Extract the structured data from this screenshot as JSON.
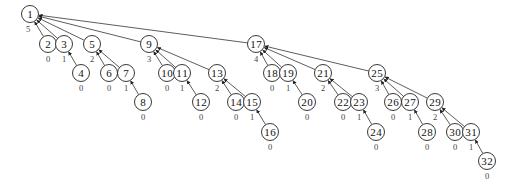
{
  "diagram": {
    "type": "binomial-tree",
    "node_radius": 8.5,
    "edge_direction": "child-to-parent",
    "nodes": [
      {
        "id": 1,
        "x": 30,
        "y": 14,
        "rank": 5,
        "parent": null
      },
      {
        "id": 2,
        "x": 48,
        "y": 44,
        "rank": 0,
        "parent": 1
      },
      {
        "id": 3,
        "x": 64,
        "y": 44,
        "rank": 1,
        "parent": 1
      },
      {
        "id": 4,
        "x": 81,
        "y": 73,
        "rank": 0,
        "parent": 3
      },
      {
        "id": 5,
        "x": 92,
        "y": 44,
        "rank": 2,
        "parent": 1
      },
      {
        "id": 6,
        "x": 109,
        "y": 73,
        "rank": 0,
        "parent": 5
      },
      {
        "id": 7,
        "x": 126,
        "y": 73,
        "rank": 1,
        "parent": 5
      },
      {
        "id": 8,
        "x": 143,
        "y": 102,
        "rank": 0,
        "parent": 7
      },
      {
        "id": 9,
        "x": 149,
        "y": 44,
        "rank": 3,
        "parent": 1
      },
      {
        "id": 10,
        "x": 167,
        "y": 73,
        "rank": 0,
        "parent": 9
      },
      {
        "id": 11,
        "x": 182,
        "y": 73,
        "rank": 1,
        "parent": 9
      },
      {
        "id": 12,
        "x": 201,
        "y": 102,
        "rank": 0,
        "parent": 11
      },
      {
        "id": 13,
        "x": 217,
        "y": 73,
        "rank": 2,
        "parent": 9
      },
      {
        "id": 14,
        "x": 236,
        "y": 102,
        "rank": 0,
        "parent": 13
      },
      {
        "id": 15,
        "x": 252,
        "y": 102,
        "rank": 1,
        "parent": 13
      },
      {
        "id": 16,
        "x": 270,
        "y": 132,
        "rank": 0,
        "parent": 15
      },
      {
        "id": 17,
        "x": 256,
        "y": 44,
        "rank": 4,
        "parent": 1
      },
      {
        "id": 18,
        "x": 272,
        "y": 73,
        "rank": 0,
        "parent": 17
      },
      {
        "id": 19,
        "x": 288,
        "y": 73,
        "rank": 1,
        "parent": 17
      },
      {
        "id": 20,
        "x": 307,
        "y": 102,
        "rank": 0,
        "parent": 19
      },
      {
        "id": 21,
        "x": 323,
        "y": 73,
        "rank": 2,
        "parent": 17
      },
      {
        "id": 22,
        "x": 343,
        "y": 102,
        "rank": 0,
        "parent": 21
      },
      {
        "id": 23,
        "x": 359,
        "y": 102,
        "rank": 1,
        "parent": 21
      },
      {
        "id": 24,
        "x": 376,
        "y": 132,
        "rank": 0,
        "parent": 23
      },
      {
        "id": 25,
        "x": 377,
        "y": 73,
        "rank": 3,
        "parent": 17
      },
      {
        "id": 26,
        "x": 393,
        "y": 102,
        "rank": 0,
        "parent": 25
      },
      {
        "id": 27,
        "x": 410,
        "y": 102,
        "rank": 1,
        "parent": 25
      },
      {
        "id": 28,
        "x": 427,
        "y": 132,
        "rank": 0,
        "parent": 27
      },
      {
        "id": 29,
        "x": 435,
        "y": 102,
        "rank": 2,
        "parent": 25
      },
      {
        "id": 30,
        "x": 455,
        "y": 132,
        "rank": 0,
        "parent": 29
      },
      {
        "id": 31,
        "x": 471,
        "y": 132,
        "rank": 1,
        "parent": 29
      },
      {
        "id": 32,
        "x": 487,
        "y": 161,
        "rank": 0,
        "parent": 31
      }
    ]
  }
}
